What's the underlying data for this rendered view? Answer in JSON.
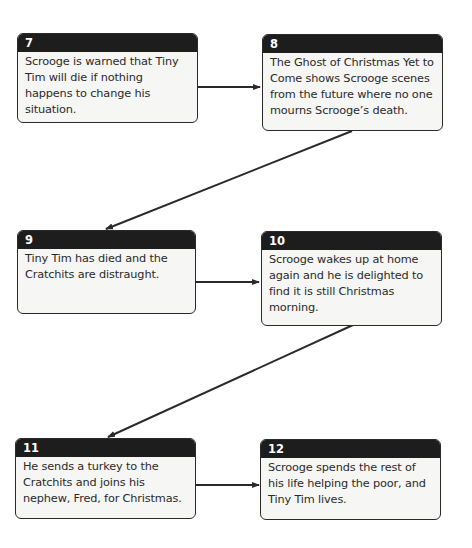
{
  "steps": [
    {
      "num": "7",
      "text": "Scrooge is warned that Tiny Tim will die if nothing happens to change his situation."
    },
    {
      "num": "8",
      "text": "The Ghost of Christmas Yet to Come shows Scrooge scenes from the future where no one mourns Scrooge’s death."
    },
    {
      "num": "9",
      "text": "Tiny Tim has died and the Cratchits are distraught."
    },
    {
      "num": "10",
      "text": "Scrooge wakes up at home again and he is delighted to find it is still Christmas morning."
    },
    {
      "num": "11",
      "text": "He sends a turkey to the Cratchits and joins his nephew, Fred, for Christmas."
    },
    {
      "num": "12",
      "text": "Scrooge spends the rest of his life helping the poor, and Tiny Tim lives."
    }
  ],
  "colors": {
    "header": "#1d1d1d",
    "box_fill": "#f6f6f4",
    "line": "#2a2a2a"
  }
}
